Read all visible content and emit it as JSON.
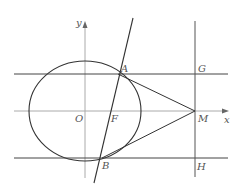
{
  "diagram": {
    "type": "geometry",
    "axes": {
      "x_label": "x",
      "y_label": "y"
    },
    "points": {
      "O": {
        "label": "O"
      },
      "F": {
        "label": "F"
      },
      "A": {
        "label": "A"
      },
      "B": {
        "label": "B"
      },
      "M": {
        "label": "M"
      },
      "G": {
        "label": "G"
      },
      "H": {
        "label": "H"
      }
    },
    "colors": {
      "line": "#333333",
      "axis": "#999999",
      "label": "#555555"
    }
  }
}
